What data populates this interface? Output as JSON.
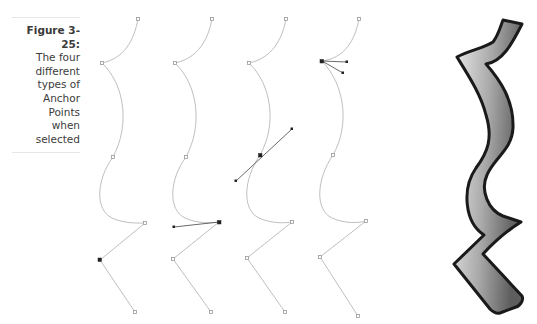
{
  "caption": {
    "figure_label": "Figure 3-25:",
    "text_lines": [
      "The four",
      "different",
      "types of",
      "Anchor Points",
      "when",
      "selected"
    ]
  },
  "diagram": {
    "paths": [
      {
        "name": "path-1",
        "selected_anchor_type": "corner point (straight segments)",
        "selected_anchor_index": 5
      },
      {
        "name": "path-2",
        "selected_anchor_type": "smooth-to-corner point (one handle)",
        "selected_anchor_index": 4
      },
      {
        "name": "path-3",
        "selected_anchor_type": "smooth point (two aligned handles)",
        "selected_anchor_index": 2
      },
      {
        "name": "path-4",
        "selected_anchor_type": "combination / cusp point (two independent handles)",
        "selected_anchor_index": 1
      }
    ],
    "colors": {
      "path_stroke": "#b8b8b8",
      "selected_anchor": "#222222",
      "shape_outline": "#1a1a1a",
      "shape_gradient_light": "#e8e8e8",
      "shape_gradient_dark": "#6e6e6e"
    },
    "filled_shape": {
      "name": "stroked-zigzag-shape",
      "fill": "gray gradient",
      "outline": "black"
    }
  }
}
